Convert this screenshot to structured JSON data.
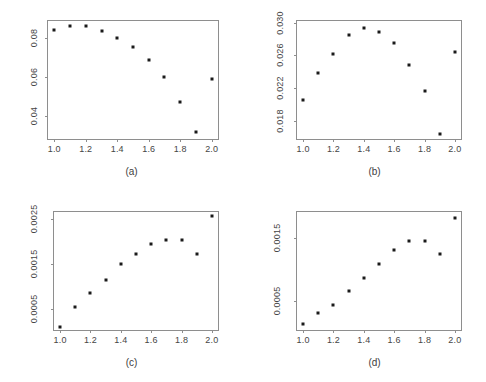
{
  "figure": {
    "background_color": "#ffffff",
    "frame_color": "#8e8e8e",
    "point_color": "#1a1a1a",
    "layout": "2x2 grid of scatter panels"
  },
  "chart_data": [
    {
      "type": "scatter",
      "panel": "a",
      "caption": "(a)",
      "title": "",
      "xlabel": "",
      "ylabel": "",
      "x": [
        1.0,
        1.1,
        1.2,
        1.3,
        1.4,
        1.5,
        1.6,
        1.7,
        1.8,
        1.9,
        2.0
      ],
      "values": [
        0.084,
        0.0862,
        0.086,
        0.0836,
        0.08,
        0.0752,
        0.0688,
        0.06,
        0.0474,
        0.0322,
        0.0588
      ],
      "xlim": [
        0.96,
        2.04
      ],
      "ylim": [
        0.0285,
        0.0885
      ],
      "xticks": [
        1.0,
        1.2,
        1.4,
        1.6,
        1.8,
        2.0
      ],
      "xtick_labels": [
        "1.0",
        "1.2",
        "1.4",
        "1.6",
        "1.8",
        "2.0"
      ],
      "yticks": [
        0.04,
        0.06,
        0.08
      ],
      "ytick_labels": [
        "0.04",
        "0.06",
        "0.08"
      ],
      "grid": false,
      "legend": false
    },
    {
      "type": "scatter",
      "panel": "b",
      "caption": "(b)",
      "title": "",
      "xlabel": "",
      "ylabel": "",
      "x": [
        1.0,
        1.1,
        1.2,
        1.3,
        1.4,
        1.5,
        1.6,
        1.7,
        1.8,
        1.9,
        2.0
      ],
      "values": [
        0.0205,
        0.0238,
        0.0262,
        0.0285,
        0.0293,
        0.0289,
        0.0275,
        0.0248,
        0.0216,
        0.0164,
        0.0264
      ],
      "xlim": [
        0.96,
        2.04
      ],
      "ylim": [
        0.0158,
        0.0302
      ],
      "xticks": [
        1.0,
        1.2,
        1.4,
        1.6,
        1.8,
        2.0
      ],
      "xtick_labels": [
        "1.0",
        "1.2",
        "1.4",
        "1.6",
        "1.8",
        "2.0"
      ],
      "yticks": [
        0.018,
        0.022,
        0.026,
        0.03
      ],
      "ytick_labels": [
        "0.018",
        "0.022",
        "0.026",
        "0.030"
      ],
      "grid": false,
      "legend": false
    },
    {
      "type": "scatter",
      "panel": "c",
      "caption": "(c)",
      "title": "",
      "xlabel": "",
      "ylabel": "",
      "x": [
        1.0,
        1.1,
        1.2,
        1.3,
        1.4,
        1.5,
        1.6,
        1.7,
        1.8,
        1.9,
        2.0
      ],
      "values": [
        0.00011,
        0.00055,
        0.00085,
        0.00115,
        0.0015,
        0.00172,
        0.00195,
        0.00204,
        0.00202,
        0.00172,
        0.00256
      ],
      "xlim": [
        0.96,
        2.04
      ],
      "ylim": [
        4e-05,
        0.00265
      ],
      "xticks": [
        1.0,
        1.2,
        1.4,
        1.6,
        1.8,
        2.0
      ],
      "xtick_labels": [
        "1.0",
        "1.2",
        "1.4",
        "1.6",
        "1.8",
        "2.0"
      ],
      "yticks": [
        0.0005,
        0.0015,
        0.0025
      ],
      "ytick_labels": [
        "0.0005",
        "0.0015",
        "0.0025"
      ],
      "grid": false,
      "legend": false
    },
    {
      "type": "scatter",
      "panel": "d",
      "caption": "(d)",
      "title": "",
      "xlabel": "",
      "ylabel": "",
      "x": [
        1.0,
        1.1,
        1.2,
        1.3,
        1.4,
        1.5,
        1.6,
        1.7,
        1.8,
        1.9,
        2.0
      ],
      "values": [
        0.00012,
        0.0003,
        0.00043,
        0.00065,
        0.00087,
        0.00108,
        0.00131,
        0.00146,
        0.00146,
        0.00124,
        0.00183
      ],
      "xlim": [
        0.96,
        2.04
      ],
      "ylim": [
        3e-05,
        0.00192
      ],
      "xticks": [
        1.0,
        1.2,
        1.4,
        1.6,
        1.8,
        2.0
      ],
      "xtick_labels": [
        "1.0",
        "1.2",
        "1.4",
        "1.6",
        "1.8",
        "2.0"
      ],
      "yticks": [
        0.0005,
        0.0015
      ],
      "ytick_labels": [
        "0.0005",
        "0.0015"
      ],
      "grid": false,
      "legend": false
    }
  ]
}
